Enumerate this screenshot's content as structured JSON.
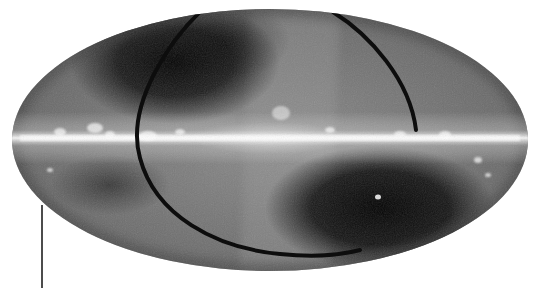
{
  "image": {
    "description": "Grayscale all-sky map in Mollweide (elliptical) projection showing a bright horizontal galactic plane band, dark high-latitude regions, and a dark curved band (ecliptic-like arc) crossing the sky",
    "projection": "mollweide",
    "colors": {
      "background": "#ffffff",
      "sky_mid": "#7a7a7a",
      "sky_dark": "#0a0a0a",
      "plane_bright": "#f2f2f2",
      "arc": "#0d0d0d",
      "pointer_line": "#111111"
    },
    "ellipse": {
      "cx": 270,
      "cy": 140,
      "rx": 258,
      "ry": 131
    },
    "features": [
      {
        "name": "galactic-plane",
        "y": 138
      },
      {
        "name": "galactic-center-bulge",
        "x": 270,
        "y": 138
      },
      {
        "name": "bright-blob-above-center",
        "x": 281,
        "y": 113
      },
      {
        "name": "bright-spot-lower-right",
        "x": 378,
        "y": 197
      },
      {
        "name": "dark-arc"
      },
      {
        "name": "pointer-line",
        "x": 42,
        "y1": 205,
        "y2": 288
      }
    ]
  }
}
